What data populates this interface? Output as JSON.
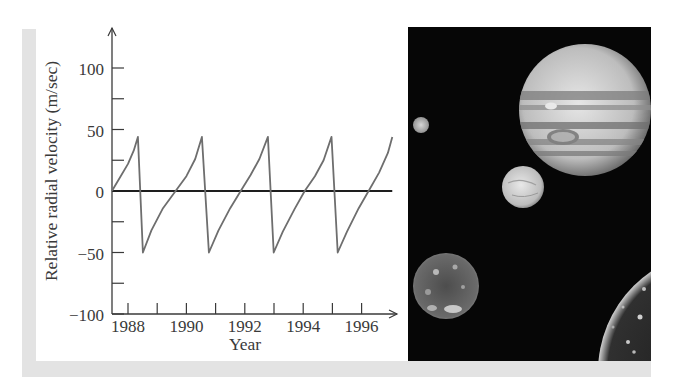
{
  "figure": {
    "photo_caption_alt": "Jupiter with four Galilean moons against black space"
  },
  "colors": {
    "curve": "#6e6e6e",
    "axis": "#3a3a3a",
    "zero_line": "#1e1e1e",
    "band": "#e3e3e3",
    "space": "#060606"
  },
  "chart_data": {
    "type": "line",
    "title": "",
    "xlabel": "Year",
    "ylabel": "Relative radial velocity (m/sec)",
    "xlim": [
      1987.45,
      1997.3
    ],
    "ylim": [
      -100,
      125
    ],
    "grid": false,
    "legend": null,
    "x_ticks": [
      1988,
      1989,
      1990,
      1991,
      1992,
      1993,
      1994,
      1995,
      1996
    ],
    "x_tick_labels": [
      "1988",
      "1990",
      "1992",
      "1994",
      "1996"
    ],
    "y_ticks": [
      -100,
      -75,
      -50,
      -25,
      0,
      25,
      50,
      75,
      100
    ],
    "y_tick_labels": [
      "100",
      "50",
      "0",
      "−50",
      "−100"
    ],
    "reference_line": {
      "y": 0,
      "from_x": 1987.45,
      "to_x": 1997.05
    },
    "series": [
      {
        "name": "Sun radial velocity due to Jupiter",
        "x": [
          1987.45,
          1987.7,
          1988.0,
          1988.2,
          1988.34,
          1988.51,
          1988.8,
          1989.2,
          1989.63,
          1990.0,
          1990.3,
          1990.53,
          1990.77,
          1991.1,
          1991.5,
          1991.86,
          1992.2,
          1992.5,
          1992.79,
          1992.99,
          1993.3,
          1993.7,
          1994.05,
          1994.4,
          1994.7,
          1994.97,
          1995.18,
          1995.5,
          1995.9,
          1996.24,
          1996.6,
          1996.9,
          1997.05
        ],
        "y": [
          0,
          10,
          22,
          33,
          44,
          -50,
          -32,
          -14,
          0,
          12,
          26,
          44,
          -50,
          -32,
          -14,
          0,
          13,
          26,
          44,
          -50,
          -33,
          -15,
          0,
          12,
          25,
          44,
          -50,
          -33,
          -14,
          0,
          15,
          31,
          44
        ]
      }
    ]
  },
  "photo": {
    "bodies": [
      {
        "name": "Jupiter",
        "cx": 177,
        "cy": 83,
        "r": 66
      },
      {
        "name": "Io",
        "cx": 13,
        "cy": 98,
        "r": 8
      },
      {
        "name": "Europa",
        "cx": 115,
        "cy": 160,
        "r": 21
      },
      {
        "name": "Ganymede",
        "cx": 38,
        "cy": 259,
        "r": 33
      },
      {
        "name": "Callisto",
        "cx": 312,
        "cy": 345,
        "r": 122
      }
    ]
  }
}
